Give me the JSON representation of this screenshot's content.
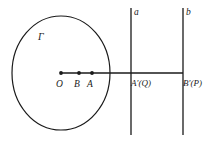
{
  "figure": {
    "type": "geometry-diagram",
    "background_color": "#ffffff",
    "stroke_color": "#1a1a1a",
    "labels": {
      "circle": "Γ",
      "center_point": "O",
      "point_b": "B",
      "point_a": "A",
      "line_a": "a",
      "line_b": "b",
      "point_a_prime": "A′(Q)",
      "point_b_prime": "B′(P)"
    },
    "geometry": {
      "circle": {
        "cx": 61,
        "cy": 73,
        "rx": 49,
        "ry": 57
      },
      "segment": {
        "x1": 61,
        "y1": 73,
        "x2": 183,
        "y2": 73
      },
      "points": [
        {
          "name": "O",
          "x": 61,
          "y": 73
        },
        {
          "name": "B",
          "x": 79,
          "y": 73
        },
        {
          "name": "A",
          "x": 92,
          "y": 73
        }
      ],
      "vertical_lines": [
        {
          "name": "a",
          "x": 131,
          "y1": 8,
          "y2": 135
        },
        {
          "name": "b",
          "x": 183,
          "y1": 8,
          "y2": 135
        }
      ]
    }
  }
}
